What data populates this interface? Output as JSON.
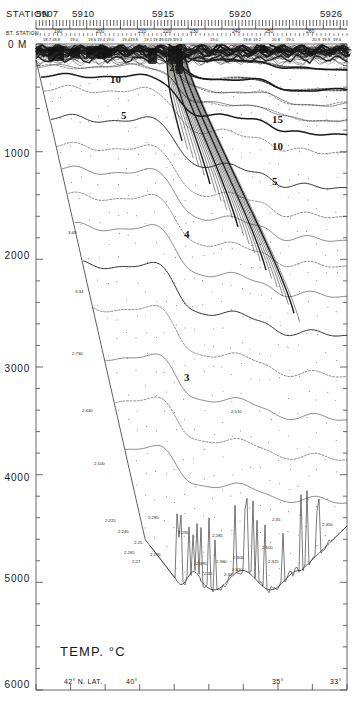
{
  "chart_data": {
    "type": "line",
    "title": "TEMP. °C",
    "subtitle": "Vertical temperature section, western North Atlantic",
    "xlabel": "",
    "ylabel": "",
    "ylim": [
      0,
      6000
    ],
    "yunit": "M",
    "y_ticks": [
      "0 M",
      "1000",
      "2000",
      "3000",
      "4000",
      "5000",
      "6000"
    ],
    "y_tick_values": [
      0,
      1000,
      2000,
      3000,
      4000,
      5000,
      6000
    ],
    "y_minor_interval": 200,
    "x_ticks": [
      "42° N. LAT.",
      "40°",
      "35°",
      "33°"
    ],
    "x_tick_values": [
      42,
      40,
      35,
      33
    ],
    "grid": false,
    "legend": "none",
    "contour_unit": "°C",
    "contour_labels": [
      {
        "value": "20",
        "x": 169,
        "y": 62
      },
      {
        "value": "10",
        "x": 110,
        "y": 74
      },
      {
        "value": "15",
        "x": 96,
        "y": 50
      },
      {
        "value": "5",
        "x": 121,
        "y": 110
      },
      {
        "value": "15",
        "x": 272,
        "y": 114
      },
      {
        "value": "10",
        "x": 272,
        "y": 141
      },
      {
        "value": "5",
        "x": 272,
        "y": 176
      },
      {
        "value": "4",
        "x": 184,
        "y": 229
      },
      {
        "value": "3",
        "x": 184,
        "y": 372
      }
    ],
    "contour_levels": [
      2,
      3,
      4,
      5,
      6,
      7,
      8,
      9,
      10,
      11,
      12,
      13,
      14,
      15,
      16,
      17,
      18,
      19,
      20
    ]
  },
  "header": {
    "station_word": "STATION",
    "station_labels": [
      {
        "text": "5907",
        "x": 36
      },
      {
        "text": "5910",
        "x": 72
      },
      {
        "text": "5915",
        "x": 152
      },
      {
        "text": "5920",
        "x": 229
      },
      {
        "text": "5926",
        "x": 320
      }
    ],
    "bt_word": "BT. STATION",
    "bt_labels": [
      {
        "text": "190",
        "x": 54
      },
      {
        "text": "200",
        "x": 96
      },
      {
        "text": "210",
        "x": 138
      },
      {
        "text": "220",
        "x": 163
      },
      {
        "text": "230",
        "x": 190
      },
      {
        "text": "240",
        "x": 232
      },
      {
        "text": "250",
        "x": 265
      },
      {
        "text": "260",
        "x": 306
      }
    ],
    "surface_values": [
      {
        "text": "18.7",
        "x": 43
      },
      {
        "text": "18.8",
        "x": 52
      },
      {
        "text": "19.0",
        "x": 70
      },
      {
        "text": "19.5",
        "x": 88
      },
      {
        "text": "19.4",
        "x": 97
      },
      {
        "text": "19.0",
        "x": 106
      },
      {
        "text": "19.4",
        "x": 122
      },
      {
        "text": "19.8",
        "x": 130
      },
      {
        "text": "19.1",
        "x": 144
      },
      {
        "text": "19.7",
        "x": 153
      },
      {
        "text": "19.6",
        "x": 159
      },
      {
        "text": "19.1",
        "x": 167
      },
      {
        "text": "19.3",
        "x": 174
      },
      {
        "text": "19.0",
        "x": 210
      },
      {
        "text": "19.8",
        "x": 243
      },
      {
        "text": "19.2",
        "x": 253
      },
      {
        "text": "20.8",
        "x": 272
      },
      {
        "text": "19.1",
        "x": 286
      },
      {
        "text": "20.9",
        "x": 312
      },
      {
        "text": "19.9",
        "x": 322
      },
      {
        "text": "19.5",
        "x": 333
      }
    ]
  },
  "bottom_values": [
    {
      "text": "3.69",
      "x": 68,
      "y": 231
    },
    {
      "text": "3.34",
      "x": 75,
      "y": 290
    },
    {
      "text": "2.730",
      "x": 72,
      "y": 352
    },
    {
      "text": "2.440",
      "x": 82,
      "y": 409
    },
    {
      "text": "2.100",
      "x": 94,
      "y": 462
    },
    {
      "text": "2.225",
      "x": 105,
      "y": 519
    },
    {
      "text": "2.245",
      "x": 118,
      "y": 530
    },
    {
      "text": "2.25",
      "x": 134,
      "y": 541
    },
    {
      "text": "2.265",
      "x": 124,
      "y": 551
    },
    {
      "text": "2.27",
      "x": 132,
      "y": 560
    },
    {
      "text": "2.285",
      "x": 148,
      "y": 516
    },
    {
      "text": "2.295",
      "x": 150,
      "y": 553
    },
    {
      "text": "2.295",
      "x": 178,
      "y": 531
    },
    {
      "text": "2.285",
      "x": 212,
      "y": 534
    },
    {
      "text": "2.395",
      "x": 196,
      "y": 562
    },
    {
      "text": "2.300",
      "x": 216,
      "y": 560
    },
    {
      "text": "2.305",
      "x": 233,
      "y": 556
    },
    {
      "text": "2.35",
      "x": 204,
      "y": 572
    },
    {
      "text": "2.32",
      "x": 224,
      "y": 573
    },
    {
      "text": "2.310",
      "x": 232,
      "y": 568
    },
    {
      "text": "2.35",
      "x": 272,
      "y": 518
    },
    {
      "text": "2.500",
      "x": 262,
      "y": 546
    },
    {
      "text": "2.325",
      "x": 268,
      "y": 560
    },
    {
      "text": "2.350",
      "x": 322,
      "y": 523
    },
    {
      "text": "2.510",
      "x": 231,
      "y": 410
    }
  ],
  "axis": {
    "y_ticks": [
      {
        "text": "0 M",
        "y": 44
      },
      {
        "text": "1000",
        "y": 155
      },
      {
        "text": "2000",
        "y": 257
      },
      {
        "text": "3000",
        "y": 370
      },
      {
        "text": "4000",
        "y": 479
      },
      {
        "text": "5000",
        "y": 580
      },
      {
        "text": "6000",
        "y": 686
      }
    ],
    "x_ticks": [
      {
        "text": "42° N. LAT.",
        "x": 64
      },
      {
        "text": "40°",
        "x": 126
      },
      {
        "text": "35°",
        "x": 272
      },
      {
        "text": "33°",
        "x": 330
      }
    ]
  },
  "title_block": {
    "label": "TEMP. °C"
  }
}
